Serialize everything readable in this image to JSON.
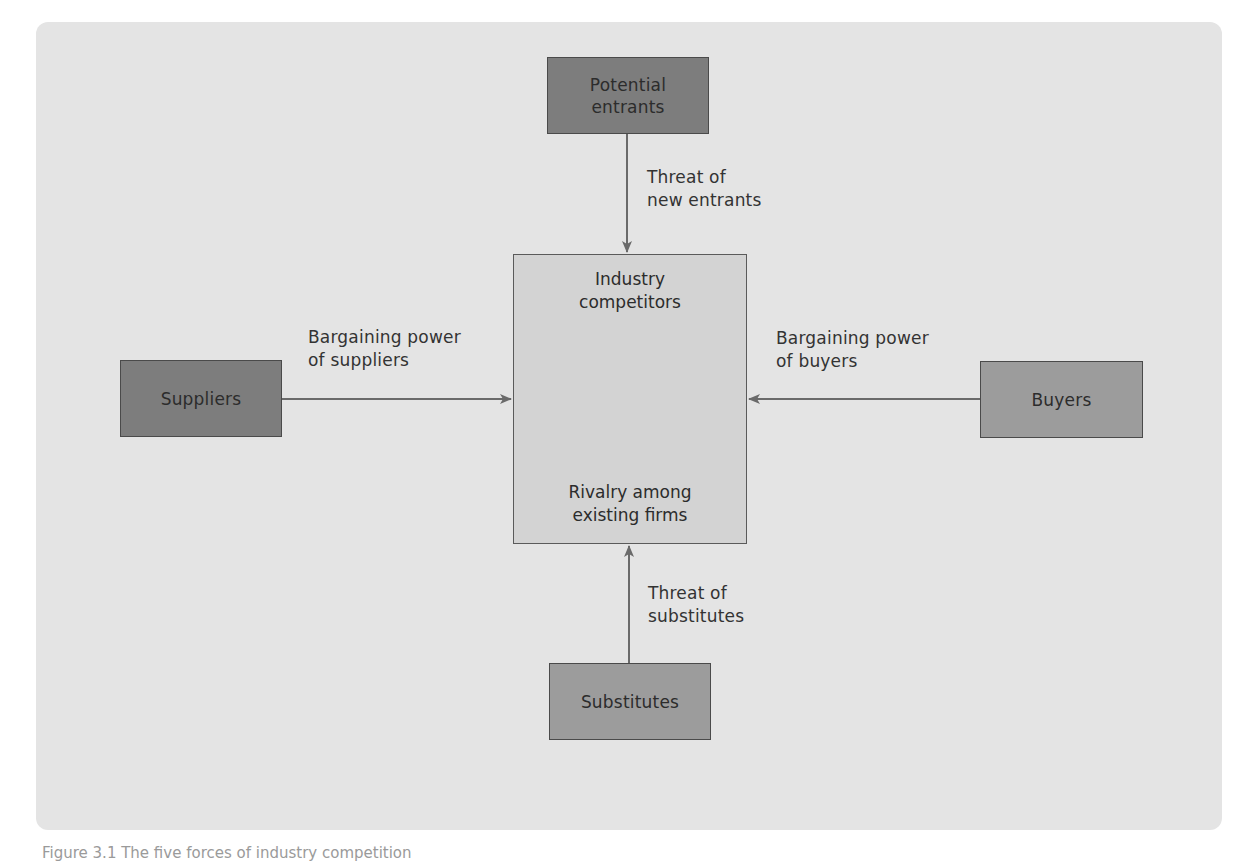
{
  "diagram": {
    "nodes": {
      "potential_entrants": {
        "label": "Potential\nentrants"
      },
      "suppliers": {
        "label": "Suppliers"
      },
      "buyers": {
        "label": "Buyers"
      },
      "substitutes": {
        "label": "Substitutes"
      },
      "industry": {
        "title": "Industry\ncompetitors",
        "subtitle": "Rivalry among\nexisting firms"
      }
    },
    "edges": {
      "entrants_to_industry": {
        "label": "Threat of\nnew entrants"
      },
      "suppliers_to_industry": {
        "label": "Bargaining power\nof suppliers"
      },
      "buyers_to_industry": {
        "label": "Bargaining power\nof buyers"
      },
      "substitutes_to_industry": {
        "label": "Threat of\nsubstitutes"
      }
    },
    "colors": {
      "panel_bg": "#e4e4e4",
      "center_box": "#d3d3d3",
      "outer_box_dark": "#7d7d7d",
      "outer_box_light": "#9c9c9c",
      "arrow": "#6a6a6a"
    }
  },
  "caption": {
    "text": "Figure 3.1 The five forces of industry competition"
  }
}
